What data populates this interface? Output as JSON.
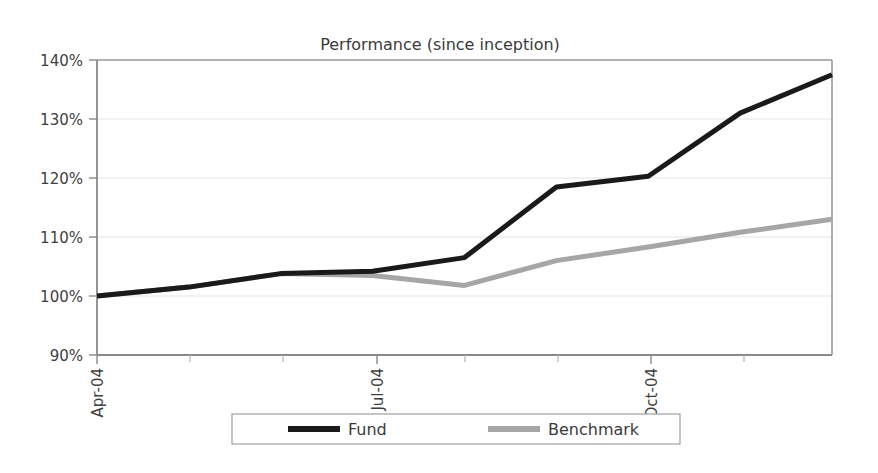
{
  "chart_data": {
    "type": "line",
    "title": "Performance (since inception)",
    "xlabel": "",
    "ylabel": "",
    "ylim": [
      90,
      140
    ],
    "ytick_labels": [
      "140%",
      "130%",
      "120%",
      "110%",
      "100%",
      "90%"
    ],
    "ytick_values": [
      140,
      130,
      120,
      110,
      100,
      90
    ],
    "grid": true,
    "grid_axis": "y",
    "legend_position": "bottom",
    "x": [
      "Apr-04",
      "May-04",
      "Jun-04",
      "Jul-04",
      "Aug-04",
      "Sep-04",
      "Oct-04",
      "Nov-04",
      "Dec-04"
    ],
    "xtick_labels_shown": [
      "Apr-04",
      "Jul-04",
      "Oct-04"
    ],
    "xtick_label_rotation": -90,
    "series": [
      {
        "name": "Fund",
        "color": "#1a1a1a",
        "line_width": 5,
        "values": [
          100.0,
          101.5,
          103.8,
          104.2,
          106.5,
          118.5,
          120.3,
          131.0,
          137.5
        ]
      },
      {
        "name": "Benchmark",
        "color": "#a6a6a6",
        "line_width": 5,
        "values": [
          100.0,
          101.5,
          103.8,
          103.5,
          101.8,
          106.0,
          108.3,
          110.8,
          113.0
        ]
      }
    ]
  },
  "legend": {
    "items": [
      {
        "label": "Fund",
        "color": "#1a1a1a"
      },
      {
        "label": "Benchmark",
        "color": "#a6a6a6"
      }
    ]
  },
  "axes": {
    "axis_color": "#808080",
    "grid_color": "#e0e0e0",
    "tick_color": "#808080"
  }
}
